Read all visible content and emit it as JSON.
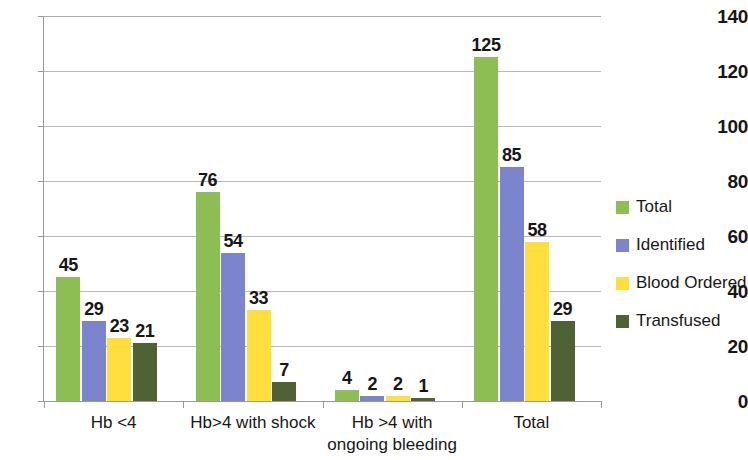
{
  "chart_data": {
    "type": "bar",
    "title": "",
    "subtitle": "",
    "xlabel": "",
    "ylabel": "",
    "ylim": [
      0,
      140
    ],
    "ytick_step": 20,
    "yticks": [
      0,
      20,
      40,
      60,
      80,
      100,
      120,
      140
    ],
    "ytick_labels": [
      "0",
      "20",
      "40",
      "60",
      "80",
      "100",
      "120",
      "140"
    ],
    "grid": "horizontal",
    "legend_position": "right",
    "data_labels": true,
    "categories": [
      "Hb <4",
      "Hb>4 with shock",
      "Hb >4 with ongoing bleeding",
      "Total"
    ],
    "category_lines": [
      [
        "Hb <4"
      ],
      [
        "Hb>4 with shock"
      ],
      [
        "Hb >4 with",
        "ongoing bleeding"
      ],
      [
        "Total"
      ]
    ],
    "series": [
      {
        "name": "Total",
        "color": "#8CBE54",
        "values": [
          45,
          76,
          4,
          125
        ]
      },
      {
        "name": "Identified",
        "color": "#7B84CC",
        "values": [
          29,
          54,
          2,
          85
        ]
      },
      {
        "name": "Blood Ordered",
        "color": "#FFDE3D",
        "values": [
          23,
          33,
          2,
          58
        ]
      },
      {
        "name": "Transfused",
        "color": "#4F6234",
        "values": [
          21,
          7,
          1,
          29
        ]
      }
    ]
  },
  "colors": {
    "total": "#8CBE54",
    "identified": "#7B84CC",
    "blood_ordered": "#FFDE3D",
    "transfused": "#4F6234",
    "gridline": "#b9b9b9",
    "axis": "#9a9a9a",
    "text": "#171717",
    "background": "#ffffff"
  }
}
